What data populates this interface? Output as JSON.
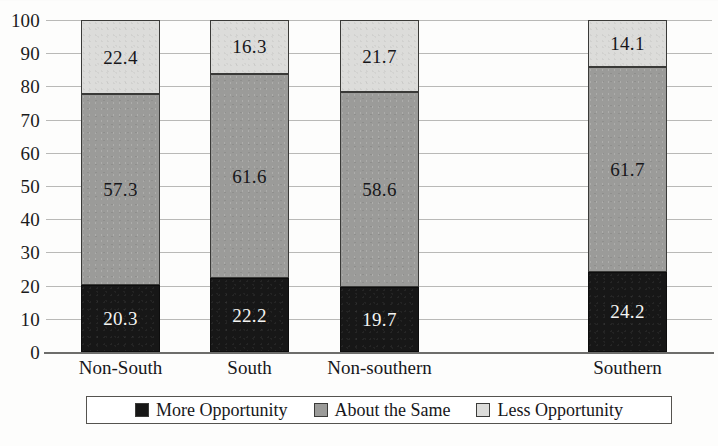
{
  "chart_data": {
    "type": "bar",
    "subtype": "stacked-bar",
    "title": "",
    "xlabel": "",
    "ylabel": "",
    "ylim": [
      0,
      100
    ],
    "ytick_step": 10,
    "yticks": [
      100,
      90,
      80,
      70,
      60,
      50,
      40,
      30,
      20,
      10,
      0
    ],
    "grid": true,
    "legend_position": "bottom",
    "categories": [
      "Non-South",
      "South",
      "Non-southern",
      "Southern"
    ],
    "series": [
      {
        "name": "More Opportunity",
        "color": "#171717",
        "values": [
          20.3,
          22.2,
          19.7,
          24.2
        ]
      },
      {
        "name": "About the Same",
        "color": "#9b9b99",
        "values": [
          57.3,
          61.6,
          58.6,
          61.7
        ]
      },
      {
        "name": "Less Opportunity",
        "color": "#dcdcda",
        "values": [
          22.4,
          16.3,
          21.7,
          14.1
        ]
      }
    ],
    "bar_labels": [
      [
        "20.3",
        "57.3",
        "22.4"
      ],
      [
        "22.2",
        "61.6",
        "16.3"
      ],
      [
        "19.7",
        "58.6",
        "21.7"
      ],
      [
        "24.2",
        "61.7",
        "14.1"
      ]
    ],
    "ytick_labels": [
      "100",
      "90",
      "80",
      "70",
      "60",
      "50",
      "40",
      "30",
      "20",
      "10",
      "0"
    ]
  },
  "legend": {
    "items": [
      {
        "label": "More Opportunity",
        "swatch": "more"
      },
      {
        "label": "About the Same",
        "swatch": "same"
      },
      {
        "label": "Less Opportunity",
        "swatch": "less"
      }
    ]
  }
}
